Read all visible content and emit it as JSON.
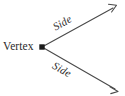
{
  "figure": {
    "kind": "angle-diagram",
    "background_color": "#ffffff",
    "stroke_color": "#4a4a4a",
    "text_color": "#2b2b2b",
    "vertex": {
      "label": "Vertex",
      "marker": "square-dot",
      "x": 42,
      "y": 47
    },
    "rays": [
      {
        "id": "upper-ray",
        "label": "Side",
        "from_x": 42,
        "from_y": 47,
        "to_x": 116,
        "to_y": 6,
        "arrowhead": "open-v",
        "label_rotation_deg": -29.5
      },
      {
        "id": "lower-ray",
        "label": "Side",
        "from_x": 42,
        "from_y": 47,
        "to_x": 118,
        "to_y": 91,
        "arrowhead": "open-v",
        "label_rotation_deg": 29.5
      }
    ]
  }
}
